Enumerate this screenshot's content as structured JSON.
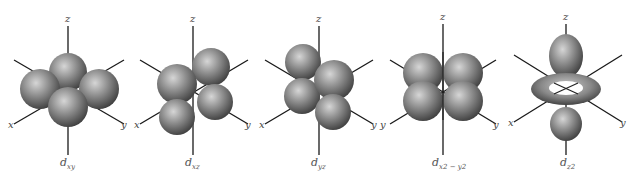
{
  "diagram": {
    "type": "d-orbital shapes",
    "axis_labels": {
      "x": "x",
      "y": "y",
      "z": "z"
    },
    "orbitals": [
      {
        "name": "d_xy",
        "main": "d",
        "sub": "xy"
      },
      {
        "name": "d_xz",
        "main": "d",
        "sub": "xz"
      },
      {
        "name": "d_yz",
        "main": "d",
        "sub": "yz"
      },
      {
        "name": "d_x2-y2",
        "main": "d",
        "sub": "x2 − y2"
      },
      {
        "name": "d_z2",
        "main": "d",
        "sub": "z2"
      }
    ],
    "colors": {
      "lobe_light": "#cfcfcf",
      "lobe_mid": "#8a8a8a",
      "lobe_dark": "#3e3e3e",
      "axis": "#1a1a1a"
    }
  }
}
